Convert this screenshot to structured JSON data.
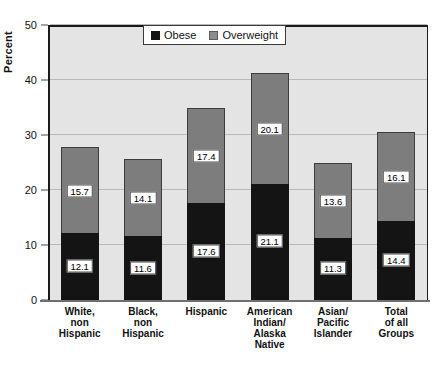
{
  "chart_data": {
    "type": "bar",
    "stacked": true,
    "title": "",
    "xlabel": "",
    "ylabel": "Percent",
    "ylim": [
      0,
      50
    ],
    "yticks": [
      0,
      10,
      20,
      30,
      40,
      50
    ],
    "ytick_labels": [
      "0",
      "10",
      "20",
      "30",
      "40",
      "50"
    ],
    "grid": true,
    "legend_position": "top-center",
    "categories": [
      "White,\nnon\nHispanic",
      "Black,\nnon\nHispanic",
      "Hispanic",
      "American\nIndian/\nAlaska\nNative",
      "Asian/\nPacific\nIslander",
      "Total\nof all\nGroups"
    ],
    "category_lines": [
      [
        "White,",
        "non",
        "Hispanic"
      ],
      [
        "Black,",
        "non",
        "Hispanic"
      ],
      [
        "Hispanic"
      ],
      [
        "American",
        "Indian/",
        "Alaska",
        "Native"
      ],
      [
        "Asian/",
        "Pacific",
        "Islander"
      ],
      [
        "Total",
        "of all",
        "Groups"
      ]
    ],
    "series": [
      {
        "name": "Obese",
        "color": "#141414",
        "values": [
          12.1,
          11.6,
          17.6,
          21.1,
          11.3,
          14.4
        ],
        "labels": [
          "12.1",
          "11.6",
          "17.6",
          "21.1",
          "11.3",
          "14.4"
        ]
      },
      {
        "name": "Overweight",
        "color": "#7d7d7d",
        "values": [
          15.7,
          14.1,
          17.4,
          20.1,
          13.6,
          16.1
        ],
        "labels": [
          "15.7",
          "14.1",
          "17.4",
          "20.1",
          "13.6",
          "16.1"
        ]
      }
    ],
    "totals": [
      27.8,
      25.7,
      35.0,
      41.2,
      24.9,
      30.5
    ]
  },
  "legend": {
    "items": [
      {
        "label": "Obese",
        "swatch": "black-square-icon"
      },
      {
        "label": "Overweight",
        "swatch": "gray-square-icon"
      }
    ]
  },
  "axis": {
    "y_title": "Percent"
  }
}
